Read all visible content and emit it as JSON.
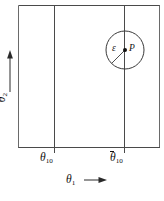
{
  "figure": {
    "background_color": "#ffffff",
    "line_color": "#3a3a3a",
    "text_color": "#111111",
    "frame": {
      "x": 18,
      "y": 5,
      "width": 142,
      "height": 143
    },
    "vertical_lines": [
      {
        "name": "theta10-lower-boundary",
        "x": 54
      },
      {
        "name": "theta10-upper-boundary",
        "x": 124
      }
    ],
    "circle": {
      "center_x": 125,
      "center_y": 50,
      "radius": 19,
      "center_dot_radius": 2
    },
    "radius_line": {
      "from_x": 125,
      "from_y": 50,
      "to_x": 111,
      "to_y": 64
    },
    "y_axis_arrow": {
      "x": 10,
      "from_y": 92,
      "to_y": 52
    },
    "x_axis_arrow": {
      "y": 180,
      "from_x": 84,
      "to_x": 106
    }
  },
  "labels": {
    "x_axis": "θ",
    "x_axis_sub": "1",
    "y_axis": "θ",
    "y_axis_sub": "2",
    "tick_lower": "θ",
    "tick_lower_sub": "10",
    "tick_upper": "θ",
    "tick_upper_sub": "10",
    "epsilon": "ε",
    "point": "P"
  }
}
